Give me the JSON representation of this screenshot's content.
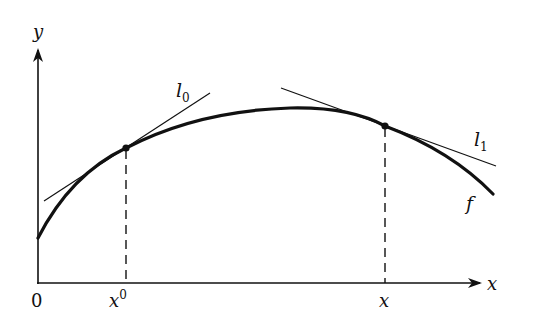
{
  "figure": {
    "axes": {
      "y_label": "y",
      "x_label": "x",
      "origin_label": "0"
    },
    "ticks": [
      {
        "base": "x",
        "superscript": "0",
        "x": 126
      },
      {
        "base": "x",
        "superscript": "",
        "x": 385
      }
    ],
    "curve": {
      "label": "f",
      "description": "concave function"
    },
    "tangents": [
      {
        "label_base": "l",
        "label_sub": "0",
        "at": "x^0"
      },
      {
        "label_base": "l",
        "label_sub": "1",
        "at": "x"
      }
    ],
    "colors": {
      "ink": "#111111",
      "background": "#ffffff"
    }
  }
}
